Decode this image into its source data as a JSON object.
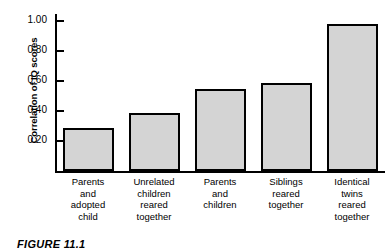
{
  "figure": {
    "caption": "FIGURE 11.1"
  },
  "chart_data": {
    "type": "bar",
    "title": "",
    "xlabel": "",
    "ylabel": "Correlation of IQ scores",
    "ylim": [
      0,
      1.1
    ],
    "grid": false,
    "legend": "none",
    "bar_color": "#d4d4d4",
    "bar_edge_color": "#000000",
    "categories": [
      "Parents and adopted child",
      "Unrelated children reared together",
      "Parents and children",
      "Siblings reared together",
      "Identical twins reared together"
    ],
    "category_lines": [
      [
        "Parents",
        "and",
        "adopted",
        "child"
      ],
      [
        "Unrelated",
        "children",
        "reared",
        "together"
      ],
      [
        "Parents",
        "and",
        "children"
      ],
      [
        "Siblings",
        "reared",
        "together"
      ],
      [
        "Identical",
        "twins",
        "reared",
        "together"
      ]
    ],
    "values": [
      0.29,
      0.39,
      0.55,
      0.59,
      0.98
    ],
    "yticks": [
      0.2,
      0.4,
      0.6,
      0.8,
      1.0
    ],
    "ytick_labels": [
      "0.20",
      "0.40",
      "0.60",
      "0.80",
      "1.00"
    ]
  }
}
